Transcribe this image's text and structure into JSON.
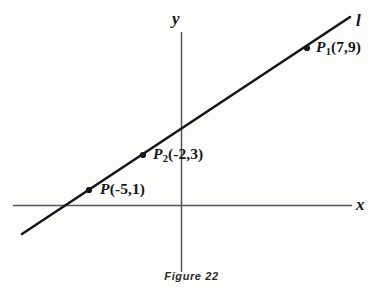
{
  "figure": {
    "caption": "Figure 22",
    "background_color": "#fdfdfc",
    "ink_color": "#16161a",
    "axis_color": "#54545a"
  },
  "axes": {
    "x_axis_label": "x",
    "y_axis_label": "y",
    "origin_px": {
      "x": 181,
      "y": 205
    },
    "x_axis_extent_px": {
      "x1": 13,
      "x2": 352,
      "y": 205
    },
    "y_axis_extent_px": {
      "x": 181,
      "y1": 32,
      "y2": 272
    }
  },
  "line": {
    "label": "l",
    "endpoints_px": {
      "x1": 22,
      "y1": 234,
      "x2": 350,
      "y2": 17
    },
    "label_position_px": {
      "x": 356,
      "y": 12
    },
    "stroke_width": 2.6
  },
  "points": [
    {
      "name": "P",
      "subscript": "",
      "coordinates": "(-5,1)",
      "label_text": "P(-5,1)",
      "marker_px": {
        "x": 89,
        "y": 190
      },
      "label_px": {
        "x": 100,
        "y": 181
      }
    },
    {
      "name": "P",
      "subscript": "2",
      "coordinates": "(-2,3)",
      "label_text": "P2(-2,3)",
      "marker_px": {
        "x": 143,
        "y": 155
      },
      "label_px": {
        "x": 153,
        "y": 146
      }
    },
    {
      "name": "P",
      "subscript": "1",
      "coordinates": "(7,9)",
      "label_text": "P1(7,9)",
      "marker_px": {
        "x": 307,
        "y": 48
      },
      "label_px": {
        "x": 316,
        "y": 39
      }
    }
  ],
  "chart_data": {
    "type": "scatter",
    "title": "Figure 22",
    "xlabel": "x",
    "ylabel": "y",
    "grid": false,
    "legend": null,
    "annotations": [
      "l"
    ],
    "series": [
      {
        "name": "l",
        "kind": "line",
        "points": [
          {
            "label": "P",
            "x": -5,
            "y": 1
          },
          {
            "label": "P2",
            "x": -2,
            "y": 3
          },
          {
            "label": "P1",
            "x": 7,
            "y": 9
          }
        ]
      }
    ],
    "x": [
      -5,
      -2,
      7
    ],
    "y": [
      1,
      3,
      9
    ],
    "xlim": [
      -11.5,
      9.5
    ],
    "ylim": [
      -4.5,
      12.5
    ]
  }
}
